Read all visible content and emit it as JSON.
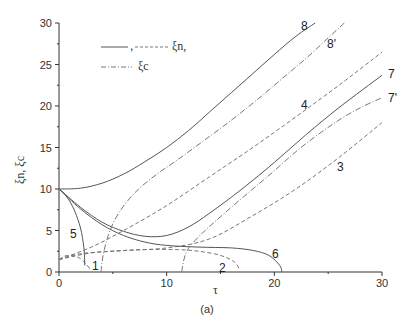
{
  "chart_data": {
    "type": "line",
    "title": "",
    "caption": "(a)",
    "xlabel": "τ",
    "ylabel": "ξn, ξc",
    "xlim": [
      0,
      30
    ],
    "ylim": [
      0,
      30
    ],
    "xticks": [
      0,
      10,
      20,
      30
    ],
    "yticks": [
      0,
      5,
      10,
      15,
      20,
      25,
      30
    ],
    "grid": false,
    "legend": {
      "position": "upper-left",
      "entries": [
        {
          "style": "solid / dashed",
          "label": "ξn,"
        },
        {
          "style": "dash-dot",
          "label": "ξc"
        }
      ]
    },
    "series": [
      {
        "name": "1",
        "style": "dashed",
        "x": [
          0,
          0.5,
          1,
          1.5,
          2,
          2.5,
          2.9
        ],
        "y": [
          1.5,
          1.9,
          2.0,
          1.9,
          1.6,
          1.0,
          0.3
        ]
      },
      {
        "name": "2",
        "style": "dashed",
        "x": [
          0,
          2,
          5,
          8,
          11,
          13,
          15,
          16.3,
          16.8
        ],
        "y": [
          1.5,
          2.2,
          2.5,
          2.7,
          2.7,
          2.5,
          2.0,
          1.2,
          0.2
        ]
      },
      {
        "name": "3",
        "style": "dashed",
        "x": [
          0,
          3,
          6,
          10,
          14,
          18,
          22,
          26,
          30
        ],
        "y": [
          1.5,
          2.3,
          2.6,
          2.9,
          4.0,
          6.8,
          10.0,
          13.8,
          18.0
        ]
      },
      {
        "name": "4",
        "style": "dashed",
        "x": [
          0,
          3,
          6,
          10,
          14,
          18,
          22,
          26,
          30
        ],
        "y": [
          1.5,
          3.0,
          5.0,
          8.0,
          11.5,
          15.0,
          18.7,
          22.5,
          26.5
        ]
      },
      {
        "name": "5",
        "style": "solid",
        "x": [
          0,
          0.5,
          1.0,
          1.5,
          2.0,
          2.3,
          2.4
        ],
        "y": [
          10,
          9.4,
          8.5,
          7.2,
          5.3,
          3.0,
          0.8
        ]
      },
      {
        "name": "6",
        "style": "solid",
        "x": [
          0,
          2,
          4,
          6,
          8,
          10,
          13,
          16,
          18,
          19.5,
          20.5,
          20.7
        ],
        "y": [
          10,
          7.6,
          5.7,
          4.4,
          3.6,
          3.2,
          3.0,
          2.9,
          2.6,
          2.0,
          0.8,
          0
        ]
      },
      {
        "name": "7",
        "style": "solid",
        "x": [
          0,
          2,
          4,
          6,
          8,
          10,
          12,
          14,
          17,
          20,
          23,
          26,
          30
        ],
        "y": [
          10,
          7.8,
          6.0,
          4.9,
          4.3,
          4.4,
          5.4,
          7.1,
          10.0,
          13.2,
          16.6,
          19.8,
          23.7
        ]
      },
      {
        "name": "7'",
        "style": "dash-dot",
        "x": [
          11.4,
          11.6,
          12,
          13,
          14,
          16,
          18,
          20,
          22,
          24,
          26,
          28,
          30
        ],
        "y": [
          0,
          1.5,
          2.8,
          4.3,
          5.5,
          7.8,
          10.0,
          12.2,
          14.5,
          16.5,
          18.3,
          19.8,
          21.0
        ]
      },
      {
        "name": "8",
        "style": "solid",
        "x": [
          0,
          2,
          4,
          6,
          8,
          10,
          12,
          14,
          16,
          18,
          20,
          22,
          23.8
        ],
        "y": [
          10,
          10.1,
          10.7,
          11.8,
          13.3,
          15.0,
          17.0,
          19.3,
          21.6,
          23.9,
          26.2,
          28.4,
          30.0
        ]
      },
      {
        "name": "8'",
        "style": "dash-dot",
        "x": [
          3.9,
          4.1,
          4.6,
          5.5,
          7,
          9,
          11,
          13,
          15,
          17,
          19,
          21,
          23,
          25,
          26.5
        ],
        "y": [
          0,
          2.0,
          4.5,
          7.0,
          9.5,
          11.7,
          13.5,
          15.4,
          17.3,
          19.3,
          21.4,
          23.6,
          25.8,
          28.2,
          30.0
        ]
      }
    ]
  },
  "curve_labels": [
    {
      "text": "1",
      "x": 92,
      "y": 270
    },
    {
      "text": "2",
      "x": 219,
      "y": 272
    },
    {
      "text": "3",
      "x": 337,
      "y": 171
    },
    {
      "text": "4",
      "x": 301,
      "y": 109
    },
    {
      "text": "5",
      "x": 70,
      "y": 238
    },
    {
      "text": "6",
      "x": 272,
      "y": 258
    },
    {
      "text": "7",
      "x": 388,
      "y": 78
    },
    {
      "text": "7'",
      "x": 388,
      "y": 102
    },
    {
      "text": "8",
      "x": 301,
      "y": 30
    },
    {
      "text": "8'",
      "x": 327,
      "y": 48
    }
  ],
  "legend_text": {
    "row1": "ξn,",
    "row2": "ξc",
    "row1_sep": ","
  },
  "axis": {
    "x_title": "τ",
    "y_title": "ξn, ξc",
    "caption": "(a)"
  }
}
